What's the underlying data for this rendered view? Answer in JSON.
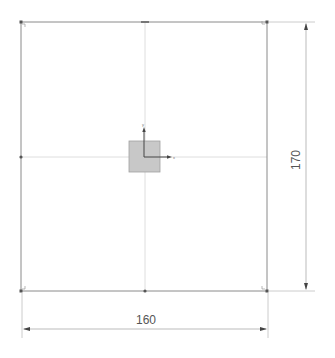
{
  "sketch": {
    "rectangle": {
      "width_value": "160",
      "height_value": "170",
      "line_color": "#888888"
    },
    "origin_block": {
      "fill_color": "#c8c8c8",
      "stroke_color": "#999999"
    },
    "axes": {
      "x_label": "x",
      "y_label": "y",
      "color": "#444444"
    },
    "dimensions": {
      "horizontal": {
        "label": "160"
      },
      "vertical": {
        "label": "170"
      }
    },
    "colors": {
      "background": "#ffffff",
      "construction_line": "#dddddd",
      "dimension_line": "#bbbbbb",
      "arrow": "#444444",
      "point": "#555555"
    }
  }
}
